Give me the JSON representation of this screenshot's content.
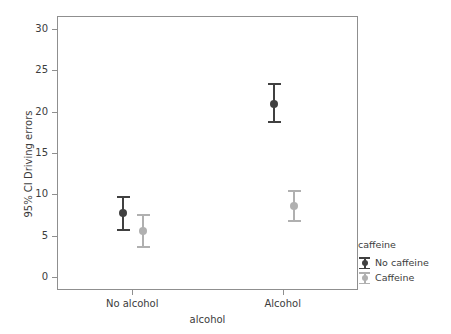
{
  "chart_data": {
    "type": "scatter",
    "title": "",
    "xlabel": "alcohol",
    "ylabel": "95% CI Driving errors",
    "categories": [
      "No alcohol",
      "Alcohol"
    ],
    "ylim": [
      0,
      31.5
    ],
    "yticks": [
      0,
      5,
      10,
      15,
      20,
      25,
      30
    ],
    "ytick_labels": [
      "0",
      "5",
      "10",
      "15",
      "20",
      "25",
      "30"
    ],
    "grid": false,
    "legend_position": "right",
    "legend_title": "caffeine",
    "series": [
      {
        "name": "No caffeine",
        "color": "#404040",
        "values": [
          7.9,
          21.1
        ],
        "ci_low": [
          5.7,
          18.7
        ],
        "ci_high": [
          9.9,
          23.6
        ]
      },
      {
        "name": "Caffeine",
        "color": "#b0b0b0",
        "values": [
          5.7,
          8.7
        ],
        "ci_low": [
          3.6,
          6.8
        ],
        "ci_high": [
          7.8,
          10.7
        ]
      }
    ]
  },
  "axes": {
    "y": {
      "title": "95% CI Driving errors",
      "ticks": [
        {
          "label": "30",
          "value": 30
        },
        {
          "label": "25",
          "value": 25
        },
        {
          "label": "20",
          "value": 20
        },
        {
          "label": "15",
          "value": 15
        },
        {
          "label": "10",
          "value": 10
        },
        {
          "label": "5",
          "value": 5
        },
        {
          "label": "0",
          "value": 0
        }
      ]
    },
    "x": {
      "title": "alcohol",
      "ticks": [
        {
          "label": "No alcohol"
        },
        {
          "label": "Alcohol"
        }
      ]
    }
  },
  "legend": {
    "title": "caffeine",
    "entries": [
      {
        "label": "No caffeine",
        "color": "#404040"
      },
      {
        "label": "Caffeine",
        "color": "#b0b0b0"
      }
    ]
  },
  "colors": {
    "frame": "#8f8f8f",
    "text": "#3c3c3c",
    "background": "#ffffff",
    "no_caffeine": "#404040",
    "caffeine": "#b0b0b0"
  }
}
